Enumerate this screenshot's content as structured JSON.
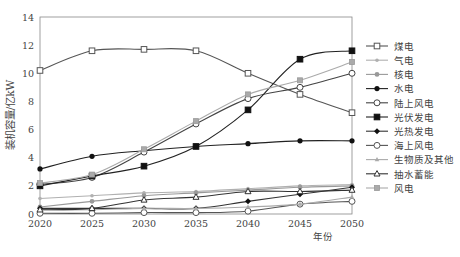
{
  "chart_data": {
    "type": "line",
    "title": "",
    "xlabel": "年份",
    "ylabel": "装机容量/亿kW",
    "ylim": [
      0,
      14
    ],
    "yticks": [
      0,
      2,
      4,
      6,
      8,
      10,
      12,
      14
    ],
    "x": [
      2020,
      2025,
      2030,
      2035,
      2040,
      2045,
      2050
    ],
    "grid": false,
    "legend_position": "right",
    "series": [
      {
        "name": "煤电",
        "marker": "square-open",
        "color": "#555555",
        "values": [
          10.2,
          11.6,
          11.7,
          11.6,
          10.0,
          8.5,
          7.2
        ]
      },
      {
        "name": "气电",
        "marker": "dot-small",
        "color": "#b0b0b0",
        "values": [
          1.1,
          1.3,
          1.5,
          1.6,
          1.8,
          2.0,
          2.1
        ]
      },
      {
        "name": "核电",
        "marker": "dot",
        "color": "#999999",
        "values": [
          0.5,
          0.9,
          1.3,
          1.5,
          1.7,
          1.9,
          2.0
        ]
      },
      {
        "name": "水电",
        "marker": "dot-filled",
        "color": "#222222",
        "values": [
          3.2,
          4.1,
          4.5,
          4.8,
          5.0,
          5.2,
          5.2
        ]
      },
      {
        "name": "陆上风电",
        "marker": "circle-open",
        "color": "#444444",
        "values": [
          2.1,
          2.6,
          4.4,
          6.4,
          8.2,
          9.0,
          10.0
        ]
      },
      {
        "name": "光伏发电",
        "marker": "square-filled",
        "color": "#222222",
        "values": [
          2.0,
          2.7,
          3.4,
          4.8,
          7.4,
          11.0,
          11.6
        ]
      },
      {
        "name": "光热发电",
        "marker": "diamond-filled",
        "color": "#333333",
        "values": [
          0.4,
          0.4,
          0.4,
          0.4,
          0.9,
          1.4,
          1.9
        ]
      },
      {
        "name": "海上风电",
        "marker": "circle-open",
        "color": "#555555",
        "values": [
          0.05,
          0.05,
          0.1,
          0.1,
          0.2,
          0.7,
          0.9
        ]
      },
      {
        "name": "生物质及其他",
        "marker": "triangle-small",
        "color": "#aaaaaa",
        "values": [
          0.3,
          0.3,
          0.4,
          0.4,
          0.5,
          0.7,
          1.2
        ]
      },
      {
        "name": "抽水蓄能",
        "marker": "triangle-open",
        "color": "#333333",
        "values": [
          0.3,
          0.4,
          1.0,
          1.2,
          1.6,
          1.6,
          1.7
        ]
      },
      {
        "name": "风电",
        "marker": "square-gray",
        "color": "#aaaaaa",
        "values": [
          2.2,
          2.8,
          4.6,
          6.6,
          8.5,
          9.5,
          10.8
        ]
      }
    ]
  }
}
